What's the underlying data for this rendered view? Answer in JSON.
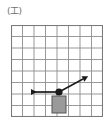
{
  "figure": {
    "label": "(工)",
    "label_icon_name": "figure-label-paren-kou"
  },
  "grid": {
    "columns": 8,
    "rows": 8,
    "cell_size_px": 11.5,
    "line_color": "#8d8d8d",
    "border_color": "#7a7a7a",
    "background_color": "#ffffff",
    "origin_x_px": 11,
    "origin_y_px": 25,
    "width_px": 92,
    "height_px": 92
  },
  "diagram": {
    "type": "physics-vector-diagram",
    "block": {
      "name": "block",
      "fill_color": "#9a9a9a",
      "stroke_color": "#555555",
      "x_px": 52,
      "y_px": 96,
      "width_px": 14,
      "height_px": 17,
      "grid_col": 3.5,
      "grid_row": 6
    },
    "point_mass": {
      "name": "point-mass-dot",
      "fill_color": "#1a1a1a",
      "x_px": 59,
      "y_px": 92,
      "radius_px": 3.6
    },
    "vectors": [
      {
        "name": "left-vector",
        "direction": "left",
        "color": "#1a1a1a",
        "from_x_px": 59,
        "from_y_px": 92,
        "to_x_px": 31,
        "to_y_px": 92,
        "length_px": 28,
        "angle_deg": 180
      },
      {
        "name": "up-right-vector",
        "direction": "up-right",
        "color": "#1a1a1a",
        "from_x_px": 59,
        "from_y_px": 92,
        "to_x_px": 83,
        "to_y_px": 79,
        "length_px": 27,
        "angle_deg": 28
      }
    ]
  }
}
